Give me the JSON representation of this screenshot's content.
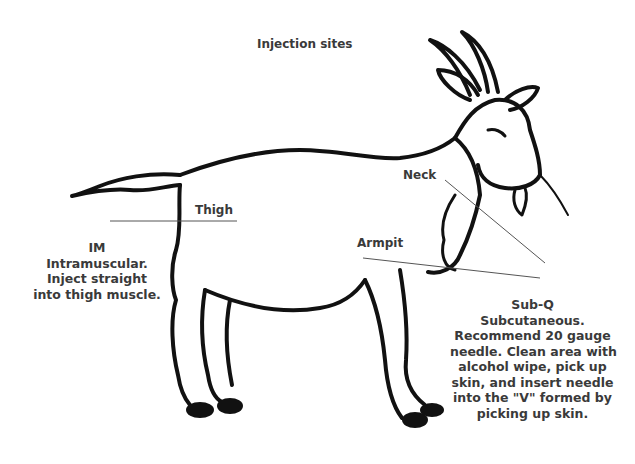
{
  "title": "Injection sites",
  "parts": {
    "thigh": "Thigh",
    "neck": "Neck",
    "armpit": "Armpit"
  },
  "im": {
    "heading": "IM",
    "lines": [
      "Intramuscular.",
      "Inject straight",
      "into thigh muscle."
    ]
  },
  "subq": {
    "heading": "Sub-Q",
    "lines": [
      "Subcutaneous.",
      "Recommend 20 gauge",
      "needle. Clean area with",
      "alcohol wipe, pick up",
      "skin, and insert needle",
      "into the \"V\" formed by",
      "picking up skin."
    ]
  },
  "illustration": {
    "subject": "goat-drawing",
    "stroke_color": "#111111",
    "pointer_line_color": "#555555"
  }
}
